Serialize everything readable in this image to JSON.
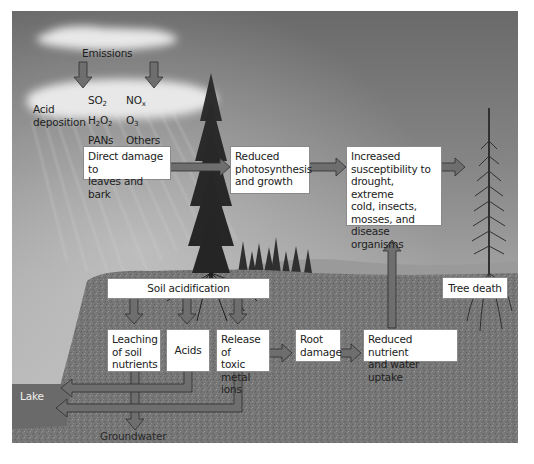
{
  "figure": {
    "colors": {
      "sky_dark": "#6a6a6a",
      "ground": "#7a7a7a",
      "lake": "#6c6c6c",
      "arrow_fill": "#6e6e6e",
      "box_bg": "#ffffff"
    }
  },
  "atmosphere": {
    "emissions_label": "Emissions",
    "acid_deposition_label_line1": "Acid",
    "acid_deposition_label_line2": "deposition",
    "pollutants": {
      "so2": "SO",
      "so2_sub": "2",
      "nox": "NO",
      "nox_sub": "x",
      "h2o2_a": "H",
      "h2o2_sub1": "2",
      "h2o2_b": "O",
      "h2o2_sub2": "2",
      "o3": "O",
      "o3_sub": "3",
      "pans": "PANs",
      "others": "Others"
    }
  },
  "nodes": {
    "direct_damage": {
      "line1": "Direct damage to",
      "line2": "leaves and bark"
    },
    "reduced_photosynthesis": {
      "line1": "Reduced",
      "line2": "photosynthesis",
      "line3": "and growth"
    },
    "increased_susceptibility": {
      "line1": "Increased",
      "line2": "susceptibility to",
      "line3": "drought, extreme",
      "line4": "cold, insects,",
      "line5": "mosses, and",
      "line6": "disease organisms"
    },
    "tree_death": {
      "label": "Tree death"
    },
    "soil_acidification": {
      "label": "Soil acidification"
    },
    "leaching": {
      "line1": "Leaching",
      "line2": "of soil",
      "line3": "nutrients"
    },
    "acids": {
      "label": "Acids"
    },
    "release_toxic": {
      "line1": "Release of",
      "line2": "toxic",
      "line3": "metal ions"
    },
    "root_damage": {
      "line1": "Root",
      "line2": "damage"
    },
    "reduced_uptake": {
      "line1": "Reduced nutrient",
      "line2": "and water uptake"
    }
  },
  "places": {
    "lake": "Lake",
    "groundwater": "Groundwater"
  }
}
